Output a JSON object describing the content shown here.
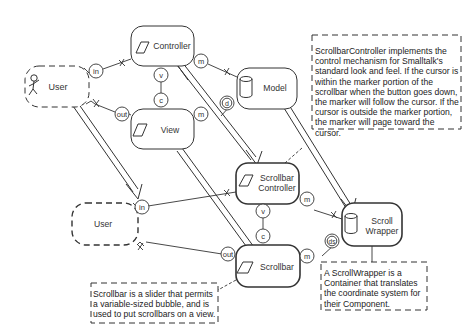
{
  "diagram": {
    "type": "MVC / Scrollbar component architecture",
    "components": [
      {
        "id": "user_top",
        "label": "User",
        "style": "dashed",
        "icon": "stick-figure-icon"
      },
      {
        "id": "controller",
        "label": "Controller",
        "icon": "parallelogram-icon"
      },
      {
        "id": "view",
        "label": "View",
        "icon": "parallelogram-icon"
      },
      {
        "id": "model",
        "label": "Model",
        "icon": "cylinder-icon"
      },
      {
        "id": "user_bottom",
        "label": "User",
        "style": "dashed-bold"
      },
      {
        "id": "scrollbar_controller",
        "label_line1": "Scrollbar",
        "label_line2": "Controller",
        "icon": "parallelogram-icon"
      },
      {
        "id": "scroll_wrapper",
        "label_line1": "Scroll",
        "label_line2": "Wrapper",
        "icon": "cylinder-icon"
      },
      {
        "id": "scrollbar",
        "label": "Scrollbar",
        "icon": "parallelogram-icon"
      }
    ],
    "ports": {
      "in": "in",
      "out": "out",
      "m": "m",
      "v": "v",
      "c": "c",
      "d": "d",
      "ds": "ds"
    },
    "notes": {
      "scrollbar_controller": "ScrollbarController implements the control mechanism for Smalltalk's standard look and feel.  If the cursor is within the marker portion of the scrollbar when the button goes down, the marker will follow the cursor.  If the cursor is outside the marker portion, the marker will page toward the cursor.",
      "scroll_wrapper": "A ScrollWrapper is a Container that translates the coordinate system for their Component.",
      "scrollbar": "Scrollbar is a slider that permits a variable-sized bubble, and is used to put scrollbars on a view."
    },
    "colors": {
      "stroke": "#333333",
      "text": "#333333",
      "background": "#ffffff"
    }
  }
}
